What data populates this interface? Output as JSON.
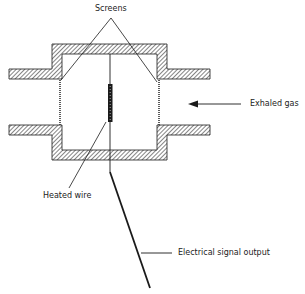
{
  "diagram": {
    "type": "hot-wire anemometer / flow sensor cross-section",
    "labels": {
      "screens": "Screens",
      "exhaled_gas": "Exhaled gas",
      "heated_wire": "Heated wire",
      "electrical_signal_output": "Electrical signal output"
    },
    "components": [
      {
        "id": "housing",
        "description": "Hatched housing walls with inlet/outlet tubes"
      },
      {
        "id": "screens",
        "description": "Two mesh screens at left and right openings"
      },
      {
        "id": "heated-wire",
        "description": "Vertical heated wire element suspended in chamber"
      },
      {
        "id": "signal-lead",
        "description": "Lead wire exiting bottom carrying electrical signal"
      },
      {
        "id": "flow-arrow",
        "description": "Arrow indicating exhaled gas flow direction (right to left)"
      }
    ],
    "colors": {
      "line": "#1a1a1a",
      "hatch": "#333333",
      "background": "#ffffff"
    }
  }
}
